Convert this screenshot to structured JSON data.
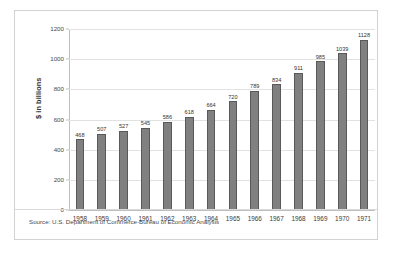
{
  "chart_data": {
    "type": "bar",
    "title": "",
    "subtitle": "",
    "xlabel": "",
    "ylabel": "$ in billions",
    "categories": [
      "1958",
      "1959",
      "1960",
      "1961",
      "1962",
      "1963",
      "1964",
      "1965",
      "1966",
      "1967",
      "1968",
      "1969",
      "1970",
      "1971"
    ],
    "values": [
      468,
      507,
      527,
      545,
      586,
      618,
      664,
      720,
      789,
      834,
      911,
      985,
      1039,
      1128
    ],
    "data_labels": [
      "468",
      "507",
      "527",
      "545",
      "586",
      "618",
      "664",
      "720",
      "789",
      "834",
      "911",
      "985",
      "1039",
      "1128"
    ],
    "ylim": [
      0,
      1200
    ],
    "yticks": [
      0,
      200,
      400,
      600,
      800,
      1000,
      1200
    ],
    "ytick_labels": [
      "0",
      "200",
      "400",
      "600",
      "800",
      "1000",
      "1200"
    ],
    "grid": "horizontal",
    "legend": "none",
    "bar_color": "#808080",
    "bar_border_color": "#595959",
    "gridline_color": "#e2e2e2",
    "axis_color": "#bfbfbf"
  },
  "footer": {
    "source_note": "Source: U.S. Department of Commerce-Bureau of Economic Analysis"
  }
}
